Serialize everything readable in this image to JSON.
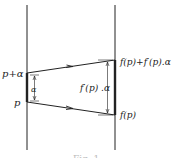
{
  "diagram": {
    "colors": {
      "line": "#222222",
      "background": "#ffffff"
    },
    "left_axis": {
      "x": 27,
      "y1": 5,
      "y2": 150
    },
    "right_axis": {
      "x": 115,
      "y1": 5,
      "y2": 150
    },
    "labels": {
      "p_plus_alpha": "p+α",
      "p": "p",
      "alpha": "α",
      "f_p_plus": "f(p)+f′(p).α",
      "f_p": "f(p)",
      "fprime_alpha": "f′(p) .α"
    },
    "caption": "Fig. 1"
  }
}
